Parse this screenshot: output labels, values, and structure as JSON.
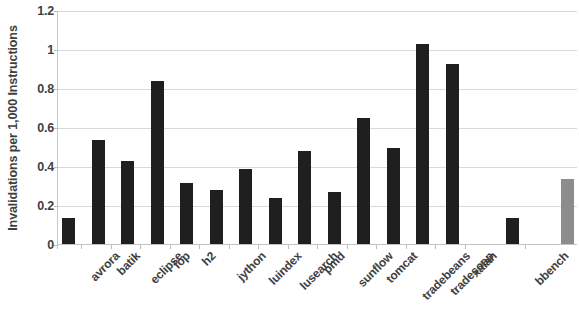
{
  "chart_data": {
    "type": "bar",
    "title": "",
    "xlabel": "",
    "ylabel": "Invalidations per 1,000 Instructions",
    "ylim": [
      0,
      1.2
    ],
    "ytick_labels": [
      "1.2",
      "1",
      "0.8",
      "0.6",
      "0.4",
      "0.2",
      "0"
    ],
    "ytick_values": [
      1.2,
      1.0,
      0.8,
      0.6,
      0.4,
      0.2,
      0
    ],
    "grid": "horizontal",
    "legend": "none",
    "categories": [
      "avrora",
      "batik",
      "eclipse",
      "fop",
      "h2",
      "jython",
      "luindex",
      "lusearch",
      "pmd",
      "sunflow",
      "tomcat",
      "tradebeans",
      "tradesoap",
      "xalan",
      "bbench",
      "h-mean"
    ],
    "values": [
      0.14,
      0.54,
      0.43,
      0.84,
      0.32,
      0.28,
      0.39,
      0.24,
      0.48,
      0.27,
      0.65,
      0.5,
      1.03,
      0.93,
      0.14,
      0.34
    ],
    "bar_colors": [
      "#1f1f1f",
      "#1f1f1f",
      "#1f1f1f",
      "#1f1f1f",
      "#1f1f1f",
      "#1f1f1f",
      "#1f1f1f",
      "#1f1f1f",
      "#1f1f1f",
      "#1f1f1f",
      "#1f1f1f",
      "#1f1f1f",
      "#1f1f1f",
      "#1f1f1f",
      "#1f1f1f",
      "#8c8c8c"
    ],
    "accent_color": "#1f1f1f",
    "summary_bar_color": "#8c8c8c",
    "gridline_color": "#d9d9d9"
  }
}
